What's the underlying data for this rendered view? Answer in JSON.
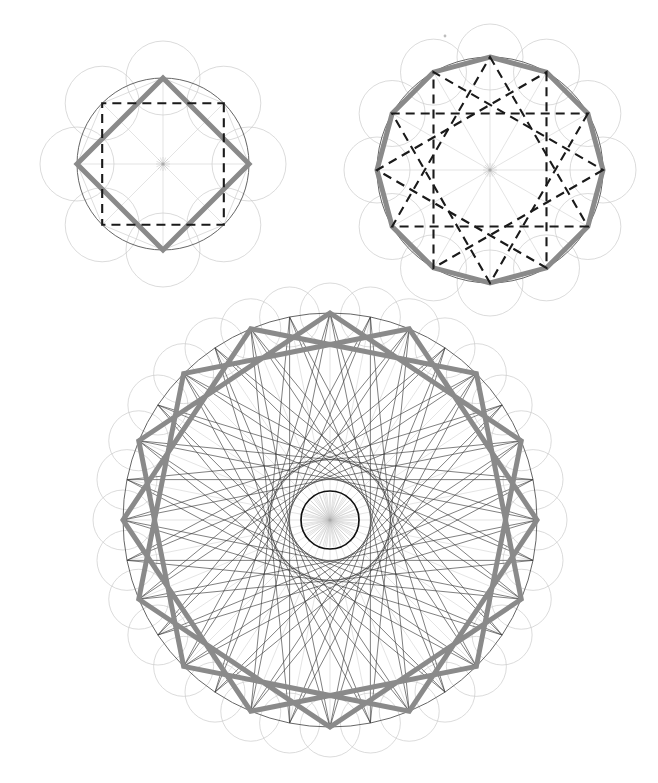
{
  "page": {
    "background_color": "#ffffff",
    "width": 658,
    "height": 783
  },
  "palette": {
    "petal_circle_stroke": "#cccccc",
    "main_circle_stroke": "#555555",
    "spoke_stroke": "#d2d2d2",
    "inner_polygon_stroke": "#cfcfcf",
    "thick_polygon_stroke": "#8a8a8a",
    "dashed_star_stroke": "#1a1a1a",
    "thin_star_stroke": "#3a3a3a",
    "envelope_circle_stroke": "#111111"
  },
  "figures": [
    {
      "id": "figure-top-left",
      "label": "octagon-square-construction",
      "center": {
        "x": 163,
        "y": 164
      },
      "main_radius": 86,
      "vertex_count": 8,
      "start_angle_deg": -90,
      "petal_radius": 37,
      "petal_count": 8,
      "thick_polygon": {
        "name": "rotated-square-diamond",
        "vertex_indices": [
          0,
          2,
          4,
          6
        ],
        "stroke_width": 5
      },
      "dashed_polygon": {
        "name": "axis-aligned-square",
        "vertex_indices": [
          1,
          3,
          5,
          7
        ],
        "stroke_width": 2.1,
        "dash": "9 6"
      },
      "show_spokes": true,
      "show_inner_polygon": true,
      "thin_star_step": 0,
      "envelope_radius": 0
    },
    {
      "id": "figure-top-right",
      "label": "dodecagon-star-construction",
      "center": {
        "x": 490,
        "y": 170
      },
      "main_radius": 113,
      "vertex_count": 12,
      "start_angle_deg": -90,
      "petal_radius": 33,
      "petal_count": 12,
      "thick_polygon": {
        "name": "dodecagon",
        "vertex_indices": [
          0,
          1,
          2,
          3,
          4,
          5,
          6,
          7,
          8,
          9,
          10,
          11
        ],
        "stroke_width": 5
      },
      "dashed_polygon": {
        "name": "star-12-over-4",
        "step": 4,
        "stroke_width": 2.1,
        "dash": "9 6"
      },
      "show_spokes": true,
      "show_inner_polygon": true,
      "thin_star_step": 0,
      "envelope_radius": 0
    },
    {
      "id": "figure-bottom",
      "label": "thirtytwo-gon-dense-star-construction",
      "center": {
        "x": 330,
        "y": 520
      },
      "main_radius": 207,
      "vertex_count": 32,
      "start_angle_deg": -90,
      "petal_radius": 30,
      "petal_count": 32,
      "thick_polygon": {
        "name": "octagram-star-16-over-3",
        "step": 3,
        "base_count": 16,
        "stroke_width": 5
      },
      "dashed_polygon": null,
      "show_spokes": true,
      "show_inner_polygon": false,
      "thin_star_step": 13,
      "envelope_radius": 29
    }
  ],
  "annotations": {
    "speck": {
      "x": 445,
      "y": 36,
      "r": 1.4,
      "label": "stray-ink-speck"
    }
  }
}
